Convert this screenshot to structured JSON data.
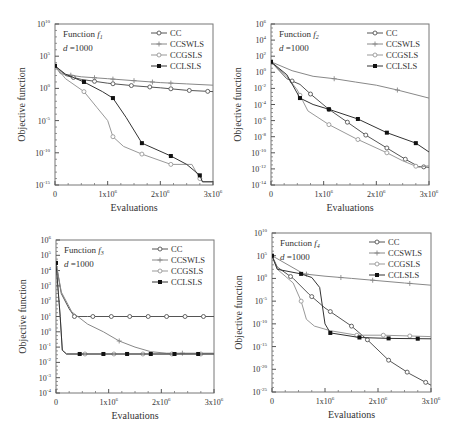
{
  "figure": {
    "legend_labels": [
      "CC",
      "CCSWLS",
      "CCGSLS",
      "CCLSLS"
    ],
    "xlabel": "Evaluations",
    "ylabel": "Objective function"
  },
  "chart_data": [
    {
      "type": "line",
      "panel": "f1",
      "title": "Function f1",
      "title_prefix": "Function ",
      "title_fn": "f",
      "title_sub": "1",
      "dim_label": "d =1000",
      "xlabel": "Evaluations",
      "ylabel": "Objective function",
      "yscale": "log",
      "xlim": [
        0,
        3000000
      ],
      "ylim_exp": [
        -15,
        10
      ],
      "x_ticks": [
        "0",
        "1x10^6",
        "2x10^6",
        "3x10^6"
      ],
      "y_ticks_exp": [
        10,
        5,
        0,
        -5,
        -10,
        -15
      ],
      "legend_position": "upper right",
      "frame": {
        "x0": 55,
        "y0": 24,
        "x1": 213,
        "y1": 185
      },
      "series": [
        {
          "name": "CC",
          "marker": "open-circle",
          "color": "#555555",
          "points": [
            [
              0,
              3.5
            ],
            [
              0.2,
              2.0
            ],
            [
              0.5,
              1.4
            ],
            [
              1.0,
              0.8
            ],
            [
              1.5,
              0.4
            ],
            [
              2.0,
              0.1
            ],
            [
              2.5,
              -0.3
            ],
            [
              3.0,
              -0.5
            ]
          ],
          "markers_at": [
            0.35,
            0.75,
            1.1,
            1.45,
            1.8,
            2.2,
            2.55,
            2.9
          ]
        },
        {
          "name": "CCSWLS",
          "marker": "plus",
          "color": "#888888",
          "points": [
            [
              0,
              3.5
            ],
            [
              0.1,
              2.3
            ],
            [
              0.5,
              1.8
            ],
            [
              1.0,
              1.5
            ],
            [
              1.5,
              1.2
            ],
            [
              2.0,
              0.9
            ],
            [
              2.5,
              0.7
            ],
            [
              3.0,
              0.5
            ]
          ],
          "markers_at": [
            0.3,
            0.75,
            1.1,
            1.5,
            1.85,
            2.2
          ]
        },
        {
          "name": "CCGSLS",
          "marker": "open-circle",
          "color": "#999999",
          "points": [
            [
              0,
              3.5
            ],
            [
              0.2,
              1.5
            ],
            [
              0.55,
              -0.5
            ],
            [
              0.8,
              -3.0
            ],
            [
              1.0,
              -5.0
            ],
            [
              1.1,
              -7.5
            ],
            [
              1.3,
              -9.0
            ],
            [
              1.65,
              -10.2
            ],
            [
              2.2,
              -11.8
            ],
            [
              2.6,
              -11.8
            ],
            [
              2.75,
              -14.0
            ],
            [
              2.8,
              -14.5
            ],
            [
              3.0,
              -14.5
            ]
          ],
          "markers_at": [
            0.55,
            1.1,
            1.65,
            2.2,
            2.75
          ]
        },
        {
          "name": "CCLSLS",
          "marker": "filled-square",
          "color": "#333333",
          "points": [
            [
              0,
              3.5
            ],
            [
              0.2,
              2.2
            ],
            [
              0.55,
              1.0
            ],
            [
              0.9,
              -0.5
            ],
            [
              1.1,
              -1.5
            ],
            [
              1.35,
              -4.5
            ],
            [
              1.65,
              -8.5
            ],
            [
              2.2,
              -10.5
            ],
            [
              2.5,
              -11.8
            ],
            [
              2.75,
              -13.5
            ],
            [
              2.8,
              -14.5
            ],
            [
              3.0,
              -14.5
            ]
          ],
          "markers_at": [
            0,
            0.55,
            1.1,
            1.65,
            2.2,
            2.75
          ]
        }
      ]
    },
    {
      "type": "line",
      "panel": "f2",
      "title": "Function f2",
      "title_prefix": "Function ",
      "title_fn": "f",
      "title_sub": "2",
      "dim_label": "d =1000",
      "xlabel": "Evaluations",
      "ylabel": "Objective function",
      "yscale": "log",
      "xlim": [
        0,
        3000000
      ],
      "ylim_exp": [
        -14,
        6
      ],
      "x_ticks": [
        "0",
        "1x10^6",
        "2x10^6",
        "3x10^6"
      ],
      "y_ticks_exp": [
        6,
        4,
        2,
        0,
        -2,
        -4,
        -6,
        -8,
        -10,
        -12,
        -14
      ],
      "legend_position": "upper right",
      "frame": {
        "x0": 271,
        "y0": 24,
        "x1": 429,
        "y1": 185
      },
      "series": [
        {
          "name": "CC",
          "marker": "open-circle",
          "color": "#555555",
          "points": [
            [
              0,
              1.3
            ],
            [
              0.3,
              -0.8
            ],
            [
              0.55,
              -1.5
            ],
            [
              0.75,
              -2.7
            ],
            [
              1.1,
              -4.6
            ],
            [
              1.45,
              -6.2
            ],
            [
              1.8,
              -7.8
            ],
            [
              2.2,
              -9.4
            ],
            [
              2.55,
              -10.8
            ],
            [
              2.8,
              -11.7
            ],
            [
              3.0,
              -11.8
            ]
          ],
          "markers_at": [
            0.4,
            0.75,
            1.1,
            1.45,
            1.8,
            2.2,
            2.55,
            2.9
          ]
        },
        {
          "name": "CCSWLS",
          "marker": "plus",
          "color": "#888888",
          "points": [
            [
              0,
              1.3
            ],
            [
              0.4,
              0.2
            ],
            [
              0.8,
              -0.5
            ],
            [
              1.2,
              -0.8
            ],
            [
              1.6,
              -1.2
            ],
            [
              2.0,
              -1.6
            ],
            [
              2.4,
              -2.2
            ],
            [
              3.0,
              -3.2
            ]
          ],
          "markers_at": [
            1.2,
            2.4
          ]
        },
        {
          "name": "CCGSLS",
          "marker": "open-circle",
          "color": "#999999",
          "points": [
            [
              0,
              1.3
            ],
            [
              0.3,
              -0.5
            ],
            [
              0.5,
              -2.2
            ],
            [
              0.6,
              -3.5
            ],
            [
              0.7,
              -4.8
            ],
            [
              1.1,
              -6.5
            ],
            [
              1.6,
              -8.2
            ],
            [
              2.2,
              -10.0
            ],
            [
              2.5,
              -11.0
            ],
            [
              2.8,
              -11.8
            ],
            [
              3.0,
              -11.6
            ]
          ],
          "markers_at": [
            0.55,
            1.1,
            1.65,
            2.2,
            2.75
          ]
        },
        {
          "name": "CCLSLS",
          "marker": "filled-square",
          "color": "#333333",
          "points": [
            [
              0,
              1.3
            ],
            [
              0.3,
              -0.3
            ],
            [
              0.55,
              -3.2
            ],
            [
              0.8,
              -4.0
            ],
            [
              1.1,
              -4.6
            ],
            [
              1.65,
              -5.8
            ],
            [
              2.2,
              -7.5
            ],
            [
              2.75,
              -8.8
            ],
            [
              3.0,
              -9.9
            ]
          ],
          "markers_at": [
            0,
            0.55,
            1.1,
            1.65,
            2.2,
            2.75
          ]
        }
      ]
    },
    {
      "type": "line",
      "panel": "f3",
      "title": "Function f3",
      "title_prefix": "Function ",
      "title_fn": "f",
      "title_sub": "3",
      "dim_label": "d =1000",
      "xlabel": "Evaluations",
      "ylabel": "Objective function",
      "yscale": "log",
      "xlim": [
        0,
        3000000
      ],
      "ylim_exp": [
        -4,
        6
      ],
      "x_ticks": [
        "0",
        "1x10^6",
        "2x10^6",
        "3x10^6"
      ],
      "y_ticks_exp": [
        6,
        5,
        4,
        3,
        2,
        1,
        0,
        -1,
        -2,
        -3,
        -4
      ],
      "legend_position": "upper right",
      "frame": {
        "x0": 56,
        "y0": 240,
        "x1": 214,
        "y1": 393
      },
      "series": [
        {
          "name": "CC",
          "marker": "open-circle",
          "color": "#555555",
          "points": [
            [
              0,
              4.5
            ],
            [
              0.1,
              2.5
            ],
            [
              0.25,
              1.5
            ],
            [
              0.35,
              1.0
            ],
            [
              0.6,
              1.0
            ],
            [
              3.0,
              1.0
            ]
          ],
          "markers_at": [
            0.35,
            0.7,
            1.05,
            1.4,
            1.75,
            2.1,
            2.45,
            2.8
          ]
        },
        {
          "name": "CCSWLS",
          "marker": "plus",
          "color": "#888888",
          "points": [
            [
              0,
              4.5
            ],
            [
              0.1,
              2.6
            ],
            [
              0.3,
              1.3
            ],
            [
              0.6,
              0.5
            ],
            [
              0.9,
              0
            ],
            [
              1.2,
              -0.6
            ],
            [
              1.5,
              -1.0
            ],
            [
              1.8,
              -1.3
            ],
            [
              2.1,
              -1.4
            ],
            [
              3.0,
              -1.4
            ]
          ],
          "markers_at": [
            1.2,
            2.4
          ]
        },
        {
          "name": "CCGSLS",
          "marker": "open-circle",
          "color": "#999999",
          "points": [
            [
              0,
              4.5
            ],
            [
              0.08,
              1.0
            ],
            [
              0.12,
              -1.2
            ],
            [
              0.2,
              -1.45
            ],
            [
              3.0,
              -1.45
            ]
          ],
          "markers_at": [
            0.55,
            1.1,
            1.65,
            2.2,
            2.75
          ]
        },
        {
          "name": "CCLSLS",
          "marker": "filled-square",
          "color": "#333333",
          "points": [
            [
              0,
              4.5
            ],
            [
              0.08,
              1.0
            ],
            [
              0.12,
              -1.2
            ],
            [
              0.2,
              -1.45
            ],
            [
              3.0,
              -1.45
            ]
          ],
          "markers_at": [
            0,
            0.45,
            0.9,
            1.35,
            1.8,
            2.25,
            2.7
          ]
        }
      ]
    },
    {
      "type": "line",
      "panel": "f4",
      "title": "Function f4",
      "title_prefix": "Function ",
      "title_fn": "f",
      "title_sub": "4",
      "dim_label": "d =1000",
      "xlabel": "Evaluations",
      "ylabel": "Objective function",
      "yscale": "log",
      "xlim": [
        0,
        3000000
      ],
      "ylim_exp": [
        -25,
        10
      ],
      "x_ticks": [
        "0",
        "1x10^6",
        "2x10^6",
        "3x10^6"
      ],
      "y_ticks_exp": [
        10,
        5,
        0,
        -5,
        -10,
        -15,
        -20,
        -25
      ],
      "legend_position": "upper right",
      "frame": {
        "x0": 272,
        "y0": 233,
        "x1": 431,
        "y1": 392
      },
      "series": [
        {
          "name": "CC",
          "marker": "open-circle",
          "color": "#555555",
          "points": [
            [
              0,
              5
            ],
            [
              0.1,
              2.5
            ],
            [
              0.4,
              0
            ],
            [
              0.7,
              -3.5
            ],
            [
              1.0,
              -6.5
            ],
            [
              1.5,
              -10.5
            ],
            [
              1.8,
              -13.5
            ],
            [
              2.2,
              -18.0
            ],
            [
              2.6,
              -21.0
            ],
            [
              3.0,
              -23.5
            ]
          ],
          "markers_at": [
            0.35,
            0.75,
            1.1,
            1.5,
            1.8,
            2.2,
            2.55,
            2.9
          ]
        },
        {
          "name": "CCSWLS",
          "marker": "plus",
          "color": "#888888",
          "points": [
            [
              0,
              5
            ],
            [
              0.6,
              1.0
            ],
            [
              1.0,
              0.5
            ],
            [
              1.5,
              0
            ],
            [
              2.0,
              -0.5
            ],
            [
              2.5,
              -1.0
            ],
            [
              3.0,
              -1.5
            ]
          ],
          "markers_at": [
            0.65,
            1.3,
            1.9,
            2.6
          ]
        },
        {
          "name": "CCGSLS",
          "marker": "open-circle",
          "color": "#999999",
          "points": [
            [
              0,
              5
            ],
            [
              0.1,
              2.0
            ],
            [
              0.4,
              -1.0
            ],
            [
              0.55,
              -5.0
            ],
            [
              0.65,
              -9.0
            ],
            [
              0.8,
              -10.5
            ],
            [
              1.1,
              -11.5
            ],
            [
              1.6,
              -12.5
            ],
            [
              2.1,
              -12.5
            ],
            [
              3.0,
              -12.8
            ]
          ],
          "markers_at": [
            0.55,
            1.6,
            2.1,
            2.6
          ]
        },
        {
          "name": "CCLSLS",
          "marker": "filled-square",
          "color": "#333333",
          "points": [
            [
              0,
              5
            ],
            [
              0.1,
              2.0
            ],
            [
              0.55,
              1.0
            ],
            [
              0.75,
              0.2
            ],
            [
              0.9,
              -2.0
            ],
            [
              1.0,
              -10.0
            ],
            [
              1.1,
              -12.0
            ],
            [
              1.65,
              -13.0
            ],
            [
              2.2,
              -13.2
            ],
            [
              3.0,
              -13.3
            ]
          ],
          "markers_at": [
            0,
            0.55,
            1.1,
            1.65,
            2.2,
            2.75
          ]
        }
      ]
    }
  ]
}
